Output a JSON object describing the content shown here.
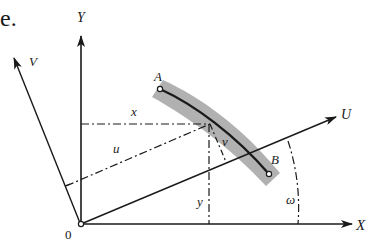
{
  "figure": {
    "corner_label": "e.",
    "axes": {
      "X": "X",
      "Y": "Y",
      "U": "U",
      "V": "V"
    },
    "origin_label": "0",
    "points": {
      "A": "A",
      "B": "B"
    },
    "coordinates": {
      "x": "x",
      "y": "y",
      "u": "u",
      "v": "v"
    },
    "angle_label": "ω",
    "colors": {
      "line": "#1a1a1a",
      "band": "#a8a8a8",
      "background": "#ffffff"
    }
  }
}
